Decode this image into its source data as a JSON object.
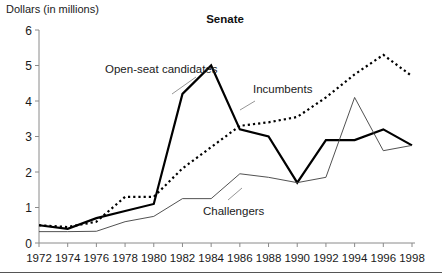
{
  "chart_data": {
    "type": "line",
    "title": "Senate",
    "ylabel": "Dollars (in millions)",
    "xlabel": "",
    "grid": false,
    "legend_position": "inline-annotations",
    "x": [
      1972,
      1974,
      1976,
      1978,
      1980,
      1982,
      1984,
      1986,
      1988,
      1990,
      1992,
      1994,
      1996,
      1998
    ],
    "xtick_labels": [
      "1972",
      "1974",
      "1976",
      "1978",
      "1980",
      "1982",
      "1984",
      "1986",
      "1988",
      "1990",
      "1992",
      "1994",
      "1996",
      "1998"
    ],
    "ytick_labels": [
      "0",
      "1",
      "2",
      "3",
      "4",
      "5",
      "6"
    ],
    "ytick_values": [
      0,
      1,
      2,
      3,
      4,
      5,
      6
    ],
    "xlim": [
      1972,
      1998
    ],
    "ylim": [
      0,
      6
    ],
    "series": [
      {
        "name": "Open-seat candidates",
        "style": "solid-thick",
        "color": "#000000",
        "width": 2.2,
        "values": [
          0.5,
          0.4,
          0.7,
          0.9,
          1.1,
          4.2,
          5.0,
          3.2,
          3.0,
          1.7,
          2.9,
          2.9,
          3.2,
          2.75
        ]
      },
      {
        "name": "Incumbents",
        "style": "dotted",
        "color": "#000000",
        "width": 2.2,
        "values": [
          0.5,
          0.45,
          0.6,
          1.3,
          1.3,
          2.1,
          2.7,
          3.3,
          3.4,
          3.55,
          4.1,
          4.75,
          5.3,
          4.7
        ]
      },
      {
        "name": "Challengers",
        "style": "solid-thin",
        "color": "#3d3d3d",
        "width": 0.9,
        "values": [
          0.32,
          0.32,
          0.33,
          0.6,
          0.75,
          1.25,
          1.25,
          1.95,
          1.85,
          1.7,
          1.85,
          4.1,
          2.6,
          2.75
        ]
      }
    ],
    "annotations": [
      {
        "text": "Open-seat candidates",
        "x_px": 105,
        "y_px": 73,
        "anchor": "start",
        "leader": [
          [
            196,
            77
          ],
          [
            172,
            94
          ]
        ]
      },
      {
        "text": "Incumbents",
        "x_px": 253,
        "y_px": 93,
        "anchor": "start",
        "leader": [
          [
            255,
            101
          ],
          [
            240,
            110
          ]
        ]
      },
      {
        "text": "Challengers",
        "x_px": 203,
        "y_px": 215,
        "anchor": "start",
        "leader": [
          [
            228,
            200
          ],
          [
            242,
            188
          ]
        ]
      }
    ]
  },
  "plot_geometry": {
    "left_px": 39,
    "right_px": 412,
    "top_px": 30,
    "bottom_px": 243
  }
}
